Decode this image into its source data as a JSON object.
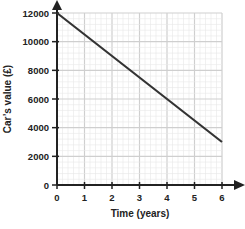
{
  "chart_data": {
    "type": "line",
    "title": "",
    "xlabel": "Time (years)",
    "ylabel": "Car’s value (£)",
    "x_ticks": [
      "0",
      "1",
      "2",
      "3",
      "4",
      "5",
      "6"
    ],
    "y_ticks": [
      "0",
      "2000",
      "4000",
      "6000",
      "8000",
      "10000",
      "12000"
    ],
    "xlim": [
      0,
      6
    ],
    "ylim": [
      0,
      12000
    ],
    "grid": true,
    "legend": null,
    "series": [
      {
        "name": "Car's value",
        "x": [
          0,
          1,
          2,
          3,
          4,
          5,
          6
        ],
        "values": [
          12000,
          10500,
          9000,
          7500,
          6000,
          4500,
          3000
        ],
        "color": "#333333"
      }
    ]
  },
  "colors": {
    "axis": "#222222",
    "grid_major": "#cfcfcf",
    "grid_minor": "#e8e8e8",
    "line": "#333333"
  }
}
